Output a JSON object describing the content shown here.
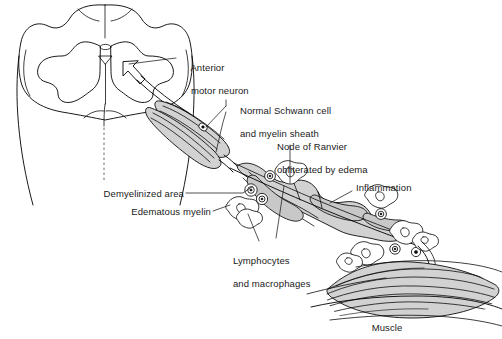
{
  "figure": {
    "type": "anatomical-illustration",
    "background_color": "#ffffff",
    "line_color": "#000000",
    "fill_color": "#d2d2d2",
    "text_color": "#1a1a1a"
  },
  "labels": {
    "anterior_motor_neuron": "Anterior\nmotor neuron",
    "anterior_motor_neuron_line1": "Anterior",
    "anterior_motor_neuron_line2": "motor neuron",
    "normal_schwann_cell_line1": "Normal Schwann cell",
    "normal_schwann_cell_line2": "and myelin sheath",
    "node_of_ranvier_line1": "Node of Ranvier",
    "node_of_ranvier_line2": "obliterated by edema",
    "demyelinized_area": "Demyelinized area",
    "edematous_myelin": "Edematous myelin",
    "lymphocytes_line1": "Lymphocytes",
    "lymphocytes_line2": "and macrophages",
    "inflammation": "Inflammation",
    "muscle": "Muscle"
  },
  "structures": {
    "spinal_cord": "spinal cord cross-section with butterfly-shaped gray matter",
    "anterior_horn_arrow": "arrow pointing to anterior horn cell",
    "myelinated_axon": "normal myelinated axon segments",
    "demyelinated_segment": "swollen edematous demyelinated nerve segment",
    "immune_cells": "lymphocytes and macrophages surrounding nerve",
    "motor_end_plate": "nerve terminal branching onto muscle fibers",
    "muscle_bundle": "skeletal muscle fiber bundle"
  }
}
